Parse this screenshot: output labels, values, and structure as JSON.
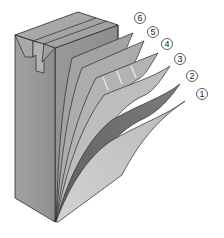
{
  "diagram": {
    "colors": {
      "background": "#ffffff",
      "carton_front": "#9a9a9a",
      "carton_top": "#a6a6a6",
      "carton_side": "#8e8e8e",
      "outline": "#2a2a2a",
      "layer_6": "#a3a3a3",
      "layer_5": "#acacac",
      "layer_4": "#b3b3b3",
      "layer_3": "#bdbdbd",
      "layer_2": "#6e6e6e",
      "layer_1": "#c4c4c4"
    },
    "labels": [
      {
        "id": "6",
        "text": "6",
        "cx": 140,
        "cy": 18
      },
      {
        "id": "5",
        "text": "5",
        "cx": 153,
        "cy": 32
      },
      {
        "id": "4",
        "text": "4",
        "cx": 167,
        "cy": 44
      },
      {
        "id": "3",
        "text": "3",
        "cx": 180,
        "cy": 59
      },
      {
        "id": "2",
        "text": "2",
        "cx": 192,
        "cy": 76
      },
      {
        "id": "1",
        "text": "1",
        "cx": 202,
        "cy": 94
      }
    ]
  }
}
